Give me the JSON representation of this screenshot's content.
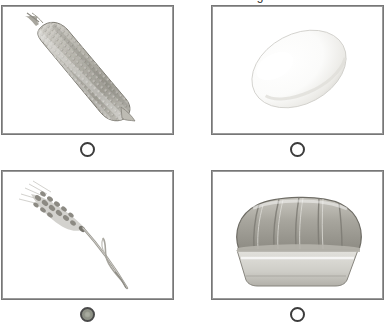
{
  "prompt": {
    "text": "Which of these is made from grain?"
  },
  "options": [
    {
      "position": "top-left",
      "image_name": "corn-cob-image",
      "alt": "ear of corn",
      "radio_name": "radio-option-corn",
      "selected": false
    },
    {
      "position": "top-right",
      "image_name": "egg-image",
      "alt": "white egg",
      "radio_name": "radio-option-egg",
      "selected": false
    },
    {
      "position": "bottom-left",
      "image_name": "wheat-stalk-image",
      "alt": "wheat stalk",
      "radio_name": "radio-option-wheat",
      "selected": true
    },
    {
      "position": "bottom-right",
      "image_name": "bread-loaf-image",
      "alt": "loaf of bread",
      "radio_name": "radio-option-bread",
      "selected": false
    }
  ],
  "colors": {
    "panel_border": "#9a9a9a",
    "panel_border_outer": "#777777",
    "radio_ring": "#3c3c3c",
    "radio_selected_fill": "#8f9287",
    "background": "#ffffff"
  }
}
